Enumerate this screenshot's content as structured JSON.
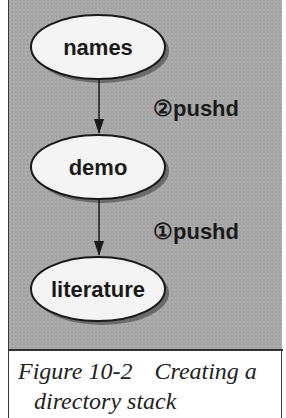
{
  "diagram": {
    "background_color": "#a9a9a9",
    "node_fill": "#f4f4f4",
    "node_stroke": "#1a1a1a",
    "shadow_color": "#6b6b6b",
    "nodes": [
      {
        "id": "names",
        "label": "names"
      },
      {
        "id": "demo",
        "label": "demo"
      },
      {
        "id": "literature",
        "label": "literature"
      }
    ],
    "edges": [
      {
        "from": "names",
        "to": "demo",
        "label": "②pushd",
        "step": 2
      },
      {
        "from": "demo",
        "to": "literature",
        "label": "①pushd",
        "step": 1
      }
    ]
  },
  "caption": {
    "figure_number": "Figure 10-2",
    "text_line1": "Creating a",
    "text_line2": "directory stack"
  }
}
